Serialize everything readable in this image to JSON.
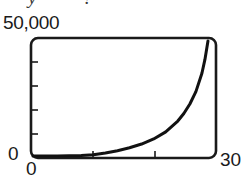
{
  "figure": {
    "clipped_title": "y = ?",
    "background_color": "#ffffff",
    "ink_color": "#1a1a1a"
  },
  "chart_data": {
    "type": "line",
    "title": "",
    "subtitle": "",
    "xlabel": "",
    "ylabel": "",
    "xlim": [
      0,
      30
    ],
    "ylim": [
      0,
      50000
    ],
    "grid": false,
    "legend": null,
    "annotations": [],
    "x_tick_labels": [
      "0",
      "30"
    ],
    "y_tick_labels": [
      "0",
      "50,000"
    ],
    "x_minor_ticks": [
      10,
      20
    ],
    "y_minor_ticks": [
      10000,
      20000,
      30000,
      40000
    ],
    "series": [
      {
        "name": "exponential growth",
        "x": [
          0,
          2,
          4,
          6,
          8,
          10,
          12,
          14,
          16,
          18,
          20,
          22,
          24,
          25,
          26,
          27,
          28,
          28.5,
          29
        ],
        "y": [
          0,
          10,
          30,
          80,
          200,
          520,
          1300,
          2300,
          3600,
          5200,
          7400,
          10500,
          15200,
          18500,
          22600,
          28000,
          36000,
          42000,
          50000
        ]
      }
    ]
  },
  "labels": {
    "y_max": "50,000",
    "y_min": "0",
    "x_min": "0",
    "x_max": "30"
  }
}
